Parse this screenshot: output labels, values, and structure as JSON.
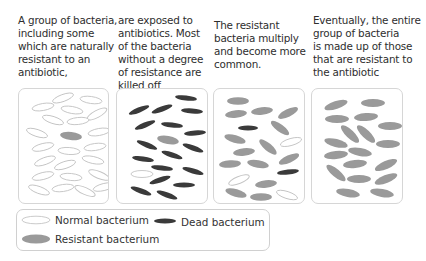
{
  "captions": [
    "A group of bacteria,\nincluding some\nwhich are naturally\nresistant to an\nantibiotic,",
    "are exposed to\nantibiotics. Most\nof the bacteria\nwithout a degree\nof resistance are\nkilled off",
    "The resistant\nbacteria multiply\nand become more\ncommon.",
    "Eventually, the entire\ngroup of bacteria\nis made up of those\nthat are resistant to\nthe antibiotic"
  ],
  "colors": {
    "normal_stroke": "#c4c4c4",
    "dead_fill": "#3a3a3a",
    "resistant_fill": "#9a9a9a",
    "panel_border": "#d6d6d6"
  },
  "panels": [
    {
      "stage": "initial-population",
      "bacteria": [
        {
          "t": "n",
          "x": 44,
          "y": 9,
          "rx": 11,
          "ry": 3.5,
          "a": -20
        },
        {
          "t": "n",
          "x": 72,
          "y": 11,
          "rx": 11,
          "ry": 3.5,
          "a": 8
        },
        {
          "t": "n",
          "x": 24,
          "y": 18,
          "rx": 11,
          "ry": 3.5,
          "a": -10
        },
        {
          "t": "n",
          "x": 53,
          "y": 21,
          "rx": 11,
          "ry": 3.5,
          "a": 10
        },
        {
          "t": "n",
          "x": 78,
          "y": 25,
          "rx": 11,
          "ry": 3.5,
          "a": -28
        },
        {
          "t": "n",
          "x": 34,
          "y": 31,
          "rx": 11,
          "ry": 3.5,
          "a": 18
        },
        {
          "t": "n",
          "x": 59,
          "y": 32,
          "rx": 11,
          "ry": 3.5,
          "a": -6
        },
        {
          "t": "n",
          "x": 18,
          "y": 44,
          "rx": 11,
          "ry": 3.5,
          "a": 18
        },
        {
          "t": "r",
          "x": 52,
          "y": 47,
          "rx": 11,
          "ry": 4,
          "a": 6
        },
        {
          "t": "n",
          "x": 80,
          "y": 43,
          "rx": 11,
          "ry": 3.5,
          "a": -10
        },
        {
          "t": "n",
          "x": 24,
          "y": 58,
          "rx": 11,
          "ry": 3.5,
          "a": -14
        },
        {
          "t": "n",
          "x": 50,
          "y": 62,
          "rx": 11,
          "ry": 3.5,
          "a": 4
        },
        {
          "t": "n",
          "x": 76,
          "y": 58,
          "rx": 11,
          "ry": 3.5,
          "a": -8
        },
        {
          "t": "n",
          "x": 26,
          "y": 72,
          "rx": 11,
          "ry": 3.5,
          "a": -20
        },
        {
          "t": "n",
          "x": 46,
          "y": 76,
          "rx": 11,
          "ry": 3.5,
          "a": -18
        },
        {
          "t": "n",
          "x": 74,
          "y": 71,
          "rx": 11,
          "ry": 3.5,
          "a": 12
        },
        {
          "t": "n",
          "x": 24,
          "y": 87,
          "rx": 11,
          "ry": 3.5,
          "a": -14
        },
        {
          "t": "n",
          "x": 52,
          "y": 88,
          "rx": 11,
          "ry": 3.5,
          "a": 6
        },
        {
          "t": "n",
          "x": 80,
          "y": 86,
          "rx": 11,
          "ry": 3.5,
          "a": 22
        },
        {
          "t": "n",
          "x": 20,
          "y": 101,
          "rx": 11,
          "ry": 3.5,
          "a": 20
        },
        {
          "t": "n",
          "x": 44,
          "y": 99,
          "rx": 11,
          "ry": 3.5,
          "a": -8
        },
        {
          "t": "n",
          "x": 66,
          "y": 102,
          "rx": 11,
          "ry": 3.5,
          "a": 24
        },
        {
          "t": "n",
          "x": 85,
          "y": 98,
          "rx": 11,
          "ry": 3.5,
          "a": -14
        }
      ]
    },
    {
      "stage": "antibiotic-exposure",
      "bacteria": [
        {
          "t": "d",
          "x": 69,
          "y": 9,
          "rx": 11,
          "ry": 2.6,
          "a": 6
        },
        {
          "t": "d",
          "x": 22,
          "y": 21,
          "rx": 11,
          "ry": 2.6,
          "a": -22
        },
        {
          "t": "d",
          "x": 45,
          "y": 20,
          "rx": 11,
          "ry": 2.6,
          "a": -20
        },
        {
          "t": "d",
          "x": 75,
          "y": 22,
          "rx": 11,
          "ry": 2.6,
          "a": 4
        },
        {
          "t": "d",
          "x": 28,
          "y": 36,
          "rx": 11,
          "ry": 2.6,
          "a": -22
        },
        {
          "t": "d",
          "x": 55,
          "y": 36,
          "rx": 11,
          "ry": 2.6,
          "a": 6
        },
        {
          "t": "d",
          "x": 78,
          "y": 44,
          "rx": 11,
          "ry": 2.6,
          "a": -4
        },
        {
          "t": "r",
          "x": 51,
          "y": 51,
          "rx": 11,
          "ry": 4,
          "a": 10
        },
        {
          "t": "d",
          "x": 30,
          "y": 56,
          "rx": 11,
          "ry": 2.6,
          "a": 22
        },
        {
          "t": "d",
          "x": 76,
          "y": 59,
          "rx": 11,
          "ry": 2.6,
          "a": 20
        },
        {
          "t": "d",
          "x": 26,
          "y": 70,
          "rx": 11,
          "ry": 2.6,
          "a": 8
        },
        {
          "t": "d",
          "x": 55,
          "y": 66,
          "rx": 11,
          "ry": 2.6,
          "a": 18
        },
        {
          "t": "d",
          "x": 45,
          "y": 79,
          "rx": 11,
          "ry": 2.6,
          "a": 6
        },
        {
          "t": "d",
          "x": 76,
          "y": 82,
          "rx": 11,
          "ry": 2.6,
          "a": 16
        },
        {
          "t": "n",
          "x": 25,
          "y": 85,
          "rx": 11,
          "ry": 3.5,
          "a": 0
        },
        {
          "t": "d",
          "x": 43,
          "y": 91,
          "rx": 11,
          "ry": 2.6,
          "a": -18
        },
        {
          "t": "d",
          "x": 67,
          "y": 96,
          "rx": 11,
          "ry": 2.6,
          "a": 0
        },
        {
          "t": "d",
          "x": 24,
          "y": 102,
          "rx": 11,
          "ry": 2.6,
          "a": 20
        },
        {
          "t": "d",
          "x": 50,
          "y": 106,
          "rx": 11,
          "ry": 2.6,
          "a": 20
        }
      ]
    },
    {
      "stage": "resistant-multiply",
      "bacteria": [
        {
          "t": "r",
          "x": 24,
          "y": 12,
          "rx": 11,
          "ry": 3.8,
          "a": 0
        },
        {
          "t": "r",
          "x": 22,
          "y": 25,
          "rx": 11,
          "ry": 3.8,
          "a": -6
        },
        {
          "t": "r",
          "x": 48,
          "y": 22,
          "rx": 11,
          "ry": 3.8,
          "a": -6
        },
        {
          "t": "r",
          "x": 74,
          "y": 24,
          "rx": 11,
          "ry": 3.8,
          "a": -26
        },
        {
          "t": "d",
          "x": 34,
          "y": 39,
          "rx": 10,
          "ry": 2.6,
          "a": 0
        },
        {
          "t": "r",
          "x": 66,
          "y": 39,
          "rx": 11,
          "ry": 3.8,
          "a": 36
        },
        {
          "t": "r",
          "x": 21,
          "y": 50,
          "rx": 11,
          "ry": 3.8,
          "a": 16
        },
        {
          "t": "r",
          "x": 54,
          "y": 58,
          "rx": 11,
          "ry": 3.8,
          "a": 40
        },
        {
          "t": "n",
          "x": 77,
          "y": 53,
          "rx": 11,
          "ry": 3.5,
          "a": -16
        },
        {
          "t": "r",
          "x": 30,
          "y": 63,
          "rx": 11,
          "ry": 3.8,
          "a": -6
        },
        {
          "t": "r",
          "x": 75,
          "y": 70,
          "rx": 11,
          "ry": 3.8,
          "a": -24
        },
        {
          "t": "r",
          "x": 16,
          "y": 75,
          "rx": 11,
          "ry": 3.8,
          "a": -4
        },
        {
          "t": "r",
          "x": 44,
          "y": 75,
          "rx": 11,
          "ry": 3.8,
          "a": 10
        },
        {
          "t": "d",
          "x": 74,
          "y": 83,
          "rx": 11,
          "ry": 2.6,
          "a": -6
        },
        {
          "t": "n",
          "x": 25,
          "y": 91,
          "rx": 11,
          "ry": 3.5,
          "a": -22
        },
        {
          "t": "r",
          "x": 52,
          "y": 95,
          "rx": 11,
          "ry": 3.8,
          "a": -6
        },
        {
          "t": "r",
          "x": 22,
          "y": 104,
          "rx": 11,
          "ry": 3.8,
          "a": 16
        },
        {
          "t": "r",
          "x": 47,
          "y": 108,
          "rx": 11,
          "ry": 3.8,
          "a": 0
        },
        {
          "t": "n",
          "x": 73,
          "y": 106,
          "rx": 11,
          "ry": 3.5,
          "a": 18
        }
      ]
    },
    {
      "stage": "fully-resistant",
      "bacteria": [
        {
          "t": "r",
          "x": 24,
          "y": 16,
          "rx": 12,
          "ry": 4,
          "a": -18
        },
        {
          "t": "r",
          "x": 61,
          "y": 14,
          "rx": 12,
          "ry": 4,
          "a": 0
        },
        {
          "t": "r",
          "x": 25,
          "y": 30,
          "rx": 12,
          "ry": 4,
          "a": 0
        },
        {
          "t": "r",
          "x": 54,
          "y": 28,
          "rx": 12,
          "ry": 4,
          "a": -4
        },
        {
          "t": "r",
          "x": 78,
          "y": 37,
          "rx": 12,
          "ry": 4,
          "a": 0
        },
        {
          "t": "r",
          "x": 38,
          "y": 45,
          "rx": 12,
          "ry": 4,
          "a": 44
        },
        {
          "t": "r",
          "x": 54,
          "y": 45,
          "rx": 12,
          "ry": 4,
          "a": 44
        },
        {
          "t": "r",
          "x": 24,
          "y": 54,
          "rx": 12,
          "ry": 4,
          "a": 14
        },
        {
          "t": "r",
          "x": 76,
          "y": 55,
          "rx": 12,
          "ry": 4,
          "a": 0
        },
        {
          "t": "r",
          "x": 48,
          "y": 63,
          "rx": 12,
          "ry": 4,
          "a": 10
        },
        {
          "t": "r",
          "x": 24,
          "y": 66,
          "rx": 12,
          "ry": 4,
          "a": -6
        },
        {
          "t": "r",
          "x": 43,
          "y": 75,
          "rx": 12,
          "ry": 4,
          "a": -6
        },
        {
          "t": "r",
          "x": 74,
          "y": 76,
          "rx": 12,
          "ry": 4,
          "a": -24
        },
        {
          "t": "r",
          "x": 24,
          "y": 84,
          "rx": 12,
          "ry": 4,
          "a": 40
        },
        {
          "t": "r",
          "x": 47,
          "y": 90,
          "rx": 12,
          "ry": 4,
          "a": 0
        },
        {
          "t": "r",
          "x": 74,
          "y": 90,
          "rx": 12,
          "ry": 4,
          "a": -22
        },
        {
          "t": "r",
          "x": 36,
          "y": 104,
          "rx": 12,
          "ry": 4,
          "a": 10
        },
        {
          "t": "r",
          "x": 70,
          "y": 104,
          "rx": 12,
          "ry": 4,
          "a": 10
        }
      ]
    }
  ],
  "legend": {
    "items": [
      {
        "type": "n",
        "label": "Normal bacterium"
      },
      {
        "type": "d",
        "label": "Dead bacterium"
      },
      {
        "type": "r",
        "label": "Resistant bacterium"
      }
    ]
  }
}
